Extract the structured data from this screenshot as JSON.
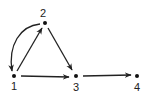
{
  "diagram": {
    "type": "directed-graph",
    "nodes": [
      {
        "id": "1",
        "label": "1",
        "x": 14,
        "y": 76,
        "label_x": 14,
        "label_y": 90
      },
      {
        "id": "2",
        "label": "2",
        "x": 45,
        "y": 23,
        "label_x": 43,
        "label_y": 17
      },
      {
        "id": "3",
        "label": "3",
        "x": 76,
        "y": 76,
        "label_x": 77,
        "label_y": 91
      },
      {
        "id": "4",
        "label": "4",
        "x": 137,
        "y": 76,
        "label_x": 138,
        "label_y": 91
      }
    ],
    "edges": [
      {
        "from": "2",
        "to": "1",
        "curved": true
      },
      {
        "from": "1",
        "to": "2",
        "curved": false
      },
      {
        "from": "2",
        "to": "3",
        "curved": false
      },
      {
        "from": "1",
        "to": "3",
        "curved": false
      },
      {
        "from": "3",
        "to": "4",
        "curved": false
      }
    ],
    "color": "#222222"
  }
}
